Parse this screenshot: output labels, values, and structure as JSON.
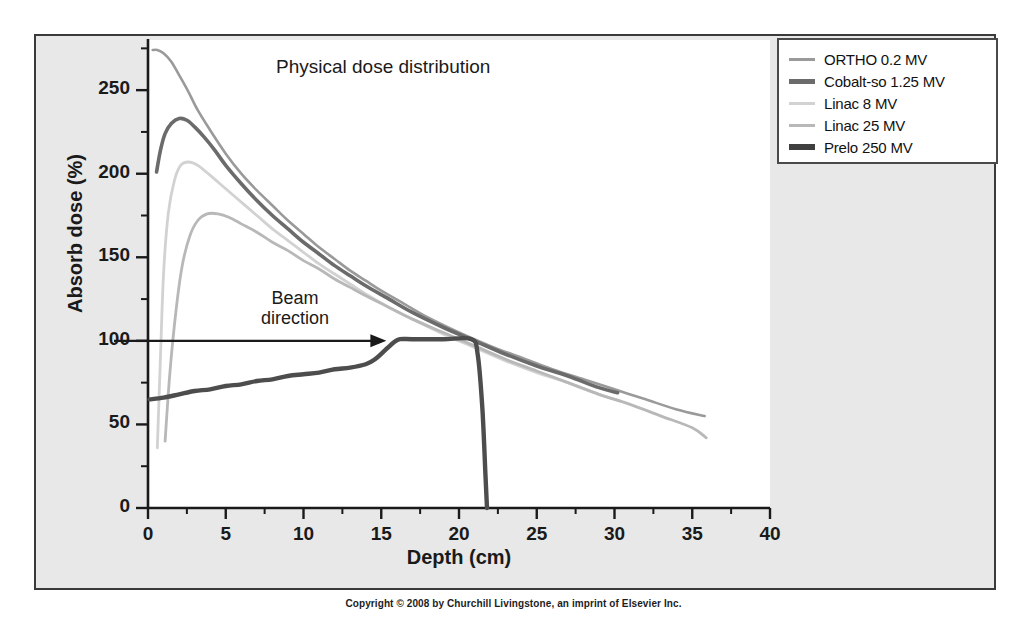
{
  "chart_data": {
    "type": "line",
    "title": "Physical dose distribution",
    "xlabel": "Depth (cm)",
    "ylabel": "Absorb dose (%)",
    "xlim": [
      0,
      40
    ],
    "ylim": [
      0,
      280
    ],
    "grid": false,
    "legend_position": "top-right",
    "xticks": [
      0,
      5,
      10,
      15,
      20,
      25,
      30,
      35,
      40
    ],
    "yticks": [
      0,
      50,
      100,
      150,
      200,
      250
    ],
    "xminor_step": 2.5,
    "yminor_step": 25,
    "annotations": [
      {
        "text": "Beam direction",
        "lines": [
          "Beam",
          "direction"
        ],
        "type": "arrow",
        "arrow_from": [
          0,
          100
        ],
        "arrow_to": [
          15.2,
          100
        ]
      }
    ],
    "series": [
      {
        "name": "ORTHO 0.2 MV",
        "color": "#9a9a9a",
        "width": 2.6,
        "points": [
          [
            0.3,
            274
          ],
          [
            0.6,
            274
          ],
          [
            1.0,
            272
          ],
          [
            1.5,
            267
          ],
          [
            2.0,
            259
          ],
          [
            2.6,
            249
          ],
          [
            3.2,
            238
          ],
          [
            4.0,
            226
          ],
          [
            5.0,
            212
          ],
          [
            6.0,
            200
          ],
          [
            7.0,
            190
          ],
          [
            8.0,
            181
          ],
          [
            9.0,
            172
          ],
          [
            10.0,
            164
          ],
          [
            11.0,
            156
          ],
          [
            12.0,
            149
          ],
          [
            13.0,
            142
          ],
          [
            14.0,
            136
          ],
          [
            15.0,
            130
          ],
          [
            16.5,
            122
          ],
          [
            18.0,
            114
          ],
          [
            20.0,
            105
          ],
          [
            22.0,
            97
          ],
          [
            24.0,
            90
          ],
          [
            26.0,
            83
          ],
          [
            28.0,
            77
          ],
          [
            30.0,
            71
          ],
          [
            32.0,
            65
          ],
          [
            34.0,
            59
          ],
          [
            35.8,
            55
          ]
        ]
      },
      {
        "name": "Cobalt-so 1.25 MV",
        "color": "#6b6b6b",
        "width": 3.6,
        "points": [
          [
            0.55,
            201
          ],
          [
            0.8,
            214
          ],
          [
            1.1,
            224
          ],
          [
            1.5,
            230
          ],
          [
            2.0,
            233
          ],
          [
            2.5,
            232
          ],
          [
            3.0,
            228
          ],
          [
            3.6,
            222
          ],
          [
            4.3,
            214
          ],
          [
            5.0,
            205
          ],
          [
            6.0,
            194
          ],
          [
            7.0,
            184
          ],
          [
            8.0,
            175
          ],
          [
            9.0,
            167
          ],
          [
            10.0,
            159
          ],
          [
            11.0,
            152
          ],
          [
            12.0,
            145
          ],
          [
            13.0,
            139
          ],
          [
            14.0,
            133
          ],
          [
            15.5,
            125
          ],
          [
            17.0,
            117
          ],
          [
            19.0,
            108
          ],
          [
            21.0,
            100
          ],
          [
            23.0,
            92
          ],
          [
            25.0,
            85
          ],
          [
            27.0,
            79
          ],
          [
            29.0,
            72
          ],
          [
            30.2,
            69
          ]
        ]
      },
      {
        "name": "Linac 8 MV",
        "color": "#d2d2d2",
        "width": 2.8,
        "points": [
          [
            0.6,
            36
          ],
          [
            0.8,
            90
          ],
          [
            1.0,
            140
          ],
          [
            1.3,
            176
          ],
          [
            1.7,
            196
          ],
          [
            2.1,
            205
          ],
          [
            2.6,
            207
          ],
          [
            3.2,
            205
          ],
          [
            4.0,
            199
          ],
          [
            5.0,
            191
          ],
          [
            6.0,
            183
          ],
          [
            7.0,
            175
          ],
          [
            8.0,
            167
          ],
          [
            9.0,
            160
          ],
          [
            10.0,
            153
          ],
          [
            11.0,
            146
          ],
          [
            12.0,
            140
          ],
          [
            13.0,
            134
          ],
          [
            14.0,
            128
          ],
          [
            15.5,
            120
          ],
          [
            17.0,
            113
          ],
          [
            19.0,
            104
          ],
          [
            21.0,
            96
          ],
          [
            23.0,
            88
          ],
          [
            25.0,
            81
          ],
          [
            27.0,
            75
          ],
          [
            29.0,
            68
          ],
          [
            30.4,
            64
          ]
        ]
      },
      {
        "name": "Linac 25 MV",
        "color": "#b8b8b8",
        "width": 2.8,
        "points": [
          [
            1.1,
            40
          ],
          [
            1.4,
            80
          ],
          [
            1.8,
            118
          ],
          [
            2.2,
            145
          ],
          [
            2.7,
            163
          ],
          [
            3.2,
            172
          ],
          [
            3.8,
            176
          ],
          [
            4.5,
            176
          ],
          [
            5.2,
            174
          ],
          [
            6.0,
            170
          ],
          [
            7.0,
            165
          ],
          [
            8.0,
            159
          ],
          [
            9.0,
            154
          ],
          [
            10.0,
            148
          ],
          [
            11.0,
            143
          ],
          [
            12.0,
            137
          ],
          [
            13.0,
            132
          ],
          [
            14.0,
            127
          ],
          [
            15.5,
            120
          ],
          [
            17.0,
            113
          ],
          [
            19.0,
            105
          ],
          [
            21.0,
            97
          ],
          [
            23.0,
            89
          ],
          [
            25.0,
            82
          ],
          [
            27.0,
            75
          ],
          [
            29.0,
            68
          ],
          [
            31.0,
            62
          ],
          [
            33.0,
            55
          ],
          [
            35.0,
            48
          ],
          [
            35.9,
            42
          ]
        ]
      },
      {
        "name": "Prelo 250 MV",
        "color": "#4d4d4d",
        "width": 4.4,
        "points": [
          [
            0.1,
            65
          ],
          [
            1.0,
            66
          ],
          [
            2.0,
            68
          ],
          [
            3.0,
            70
          ],
          [
            4.0,
            71
          ],
          [
            5.0,
            73
          ],
          [
            6.0,
            74
          ],
          [
            7.0,
            76
          ],
          [
            8.0,
            77
          ],
          [
            9.0,
            79
          ],
          [
            10.0,
            80
          ],
          [
            11.0,
            81
          ],
          [
            12.0,
            83
          ],
          [
            13.0,
            84
          ],
          [
            14.0,
            86
          ],
          [
            14.6,
            89
          ],
          [
            15.2,
            94
          ],
          [
            15.8,
            99
          ],
          [
            16.2,
            101
          ],
          [
            17.0,
            101
          ],
          [
            19.0,
            101
          ],
          [
            20.8,
            101
          ],
          [
            21.2,
            92
          ],
          [
            21.5,
            60
          ],
          [
            21.7,
            20
          ],
          [
            21.8,
            0
          ]
        ]
      }
    ]
  },
  "legend": {
    "items": [
      {
        "label": "ORTHO 0.2 MV",
        "color": "#9a9a9a",
        "thickness": 3
      },
      {
        "label": "Cobalt-so 1.25 MV",
        "color": "#6b6b6b",
        "thickness": 5
      },
      {
        "label": "Linac 8 MV",
        "color": "#d2d2d2",
        "thickness": 3
      },
      {
        "label": "Linac 25 MV",
        "color": "#b8b8b8",
        "thickness": 3
      },
      {
        "label": "Prelo 250 MV",
        "color": "#3f3f3f",
        "thickness": 6
      }
    ]
  },
  "footer": {
    "copyright": "Copyright © 2008 by Churchill Livingstone, an imprint of Elsevier Inc."
  },
  "colors": {
    "slide_background": "#e8e8e8",
    "plot_background": "#ffffff",
    "frame_border": "#3a3a3a",
    "axis": "#1a1a1a",
    "text": "#1a1a1a"
  }
}
